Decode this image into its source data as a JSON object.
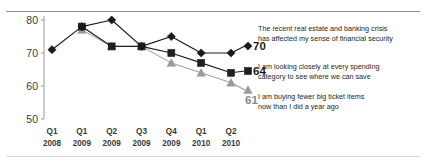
{
  "chart_data": {
    "type": "line",
    "title": "",
    "xlabel": "",
    "ylabel": "",
    "ylim": [
      50,
      80
    ],
    "yticks": [
      50,
      60,
      70,
      80
    ],
    "grid": false,
    "legend_position": "right-inline-end-labels",
    "categories": [
      "Q1 2008",
      "Q1 2009",
      "Q2 2009",
      "Q3 2009",
      "Q4 2009",
      "Q1 2010",
      "Q2 2010"
    ],
    "category_lines": [
      [
        "Q1",
        "2008"
      ],
      [
        "Q1",
        "2009"
      ],
      [
        "Q2",
        "2009"
      ],
      [
        "Q3",
        "2009"
      ],
      [
        "Q4",
        "2009"
      ],
      [
        "Q1",
        "2010"
      ],
      [
        "Q2",
        "2010"
      ]
    ],
    "series": [
      {
        "name": "The recent real estate and banking crisis has affected my sense of financial security",
        "label_line_1": "The recent real estate and banking crisis",
        "label_line_2": "has affected my sense of financial security",
        "marker": "diamond",
        "color": "#1a1a1a",
        "end_value": 70,
        "values": [
          71,
          78,
          80,
          72,
          75,
          70,
          70
        ]
      },
      {
        "name": "I am looking closely at every spending category to see where we can save",
        "label_line_1": "I am looking closely at every spending",
        "label_line_2": "category to see where we can save",
        "marker": "square",
        "color": "#1f1f1f",
        "end_value": 64,
        "values": [
          null,
          78,
          72,
          72,
          70,
          67,
          64
        ]
      },
      {
        "name": "I am buying fewer big ticket items now than I did a year ago",
        "label_line_1": "I am buying fewer big ticket items",
        "label_line_2": "now than I did a year ago",
        "marker": "triangle",
        "color": "#9a9a9a",
        "end_value": 61,
        "values": [
          null,
          77,
          72,
          72,
          67,
          64,
          61
        ]
      }
    ]
  },
  "axis": {
    "y_tick_labels": [
      "80",
      "70",
      "60",
      "50"
    ]
  },
  "legend": {
    "values": [
      "70",
      "64",
      "61"
    ]
  }
}
